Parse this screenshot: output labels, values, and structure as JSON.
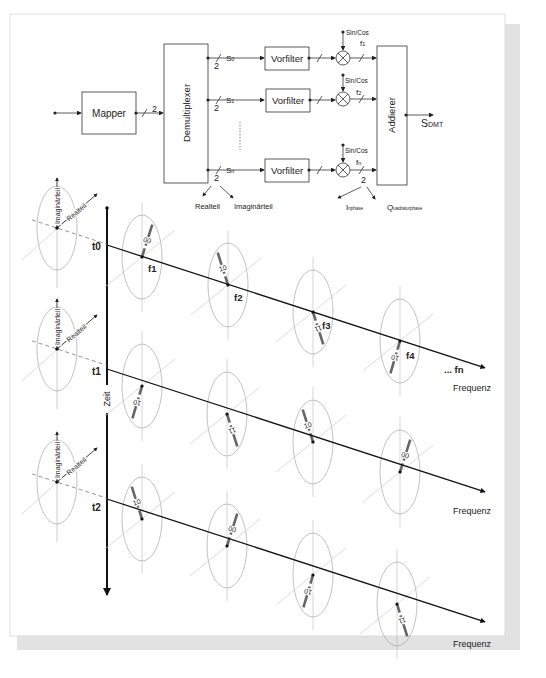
{
  "block_diagram": {
    "mapper_label": "Mapper",
    "mapper_bus_width": "2",
    "demux_label": "Demultiplexer",
    "adder_label": "Addierer",
    "output_label": "S",
    "output_subscript": "DMT",
    "branches": [
      {
        "signal": "S",
        "signal_sub": "0",
        "filter_label": "Vorfilter",
        "osc_label": "Sin/Cos",
        "freq": "f",
        "freq_sub": "1",
        "bus_width": "2"
      },
      {
        "signal": "S",
        "signal_sub": "1",
        "filter_label": "Vorfilter",
        "osc_label": "Sin/Cos",
        "freq": "f",
        "freq_sub": "2",
        "bus_width": "2"
      },
      {
        "signal": "S",
        "signal_sub": "n",
        "filter_label": "Vorfilter",
        "osc_label": "Sin/Cos",
        "freq": "f",
        "freq_sub": "n",
        "bus_width": "2"
      }
    ],
    "demux_out_width": "2",
    "split_left_label": "Realteil",
    "split_right_label": "Imaginärteil",
    "mixer_out_width": "2",
    "inphase_cap": "I",
    "inphase_rest": "nphase",
    "quad_cap": "Q",
    "quad_rest": "uadraturphase"
  },
  "constellation_diagram": {
    "time_axis_label": "Zeit",
    "axis_imag_label": "Imaginärteil",
    "axis_real_label": "Realteil",
    "frequency_axis_label": "Frequenz",
    "last_freq_label": "... fn",
    "rows": [
      {
        "time": "t0",
        "symbols": [
          {
            "freq": "f1",
            "bits": "00"
          },
          {
            "freq": "f2",
            "bits": "10"
          },
          {
            "freq": "f3",
            "bits": "11"
          },
          {
            "freq": "f4",
            "bits": "10"
          }
        ]
      },
      {
        "time": "t1",
        "symbols": [
          {
            "freq": "",
            "bits": "10"
          },
          {
            "freq": "",
            "bits": "11"
          },
          {
            "freq": "",
            "bits": "10"
          },
          {
            "freq": "",
            "bits": "00"
          }
        ]
      },
      {
        "time": "t2",
        "symbols": [
          {
            "freq": "",
            "bits": "10"
          },
          {
            "freq": "",
            "bits": "00"
          },
          {
            "freq": "",
            "bits": "10"
          },
          {
            "freq": "",
            "bits": "11"
          }
        ]
      }
    ]
  }
}
